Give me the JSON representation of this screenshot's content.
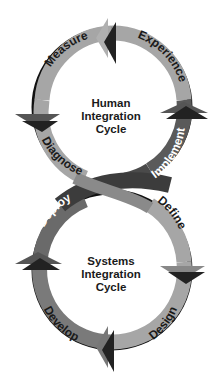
{
  "diagram": {
    "type": "figure-eight cycle diagram",
    "top_cycle": {
      "title_lines": [
        "Human",
        "Integration",
        "Cycle"
      ],
      "stages": [
        "Experience",
        "Implement",
        "Diagnose",
        "Measure"
      ]
    },
    "bottom_cycle": {
      "title_lines": [
        "Systems",
        "Integration",
        "Cycle"
      ],
      "stages": [
        "Define",
        "Design",
        "Develop",
        "Deploy"
      ]
    },
    "colors": {
      "light_band": "#a6a6a6",
      "mid_band": "#7a7a7a",
      "dark_band": "#3c3c3c",
      "shadow": "#111111",
      "text_dark": "#1a1a1a",
      "text_light": "#ffffff"
    }
  }
}
